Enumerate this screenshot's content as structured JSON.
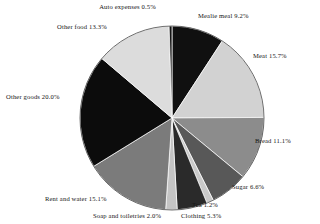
{
  "chart_data": {
    "type": "pie",
    "title": "",
    "subtitle": "",
    "xlabel": "",
    "ylabel": "",
    "legend_position": "none",
    "grid": false,
    "units": "percent",
    "start_angle_deg": 0,
    "direction": "clockwise",
    "total": 100.0,
    "categories": [
      "Mealie meal",
      "Meat",
      "Bread",
      "Sugar",
      "Tea",
      "Clothing",
      "Soap and toiletries",
      "Rent and water",
      "Other goods",
      "Other food",
      "Auto expenses"
    ],
    "values": [
      9.2,
      15.7,
      11.1,
      6.6,
      1.2,
      5.3,
      2.0,
      15.1,
      20.0,
      13.3,
      0.5
    ],
    "colors": [
      "#101010",
      "#d2d2d2",
      "#8c8c8c",
      "#585858",
      "#c9c9c9",
      "#2a2a2a",
      "#c4c4c4",
      "#7b7b7b",
      "#0c0c0c",
      "#dcdcdc",
      "#151515"
    ],
    "slices": [
      {
        "label": "Mealie meal",
        "value": 9.2,
        "text": "Mealie meal 9.2%",
        "color": "#101010"
      },
      {
        "label": "Meat",
        "value": 15.7,
        "text": "Meat 15.7%",
        "color": "#d2d2d2"
      },
      {
        "label": "Bread",
        "value": 11.1,
        "text": "Bread 11.1%",
        "color": "#8c8c8c"
      },
      {
        "label": "Sugar",
        "value": 6.6,
        "text": "Sugar 6.6%",
        "color": "#585858"
      },
      {
        "label": "Tea",
        "value": 1.2,
        "text": "Tea 1.2%",
        "color": "#c9c9c9"
      },
      {
        "label": "Clothing",
        "value": 5.3,
        "text": "Clothing 5.3%",
        "color": "#2a2a2a"
      },
      {
        "label": "Soap and toiletries",
        "value": 2.0,
        "text": "Soap and toiletries 2.0%",
        "color": "#c4c4c4"
      },
      {
        "label": "Rent and water",
        "value": 15.1,
        "text": "Rent and water 15.1%",
        "color": "#7b7b7b"
      },
      {
        "label": "Other goods",
        "value": 20.0,
        "text": "Other goods 20.0%",
        "color": "#0c0c0c"
      },
      {
        "label": "Other food",
        "value": 13.3,
        "text": "Other food 13.3%",
        "color": "#dcdcdc"
      },
      {
        "label": "Auto expenses",
        "value": 0.5,
        "text": "Auto expenses 0.5%",
        "color": "#151515"
      }
    ]
  },
  "labels": {
    "auto_expenses": "Auto expenses 0.5%",
    "mealie_meal": "Mealie meal 9.2%",
    "meat": "Meat 15.7%",
    "bread": "Bread 11.1%",
    "sugar": "Sugar 6.6%",
    "tea": "Tea 1.2%",
    "clothing": "Clothing 5.3%",
    "soap_and_toiletries": "Soap and toiletries 2.0%",
    "rent_and_water": "Rent and water 15.1%",
    "other_goods": "Other goods 20.0%",
    "other_food": "Other food 13.3%"
  },
  "style": {
    "background": "#ffffff",
    "outline": "#4a4a4a",
    "text": "#141414"
  },
  "geometry": {
    "cx": 172,
    "cy": 118,
    "r": 92
  }
}
